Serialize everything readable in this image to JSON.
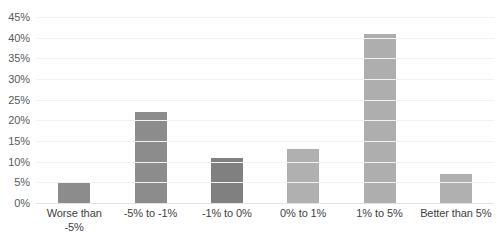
{
  "chart_data": {
    "type": "bar",
    "title": "",
    "subtitle": "",
    "xlabel": "",
    "ylabel": "",
    "categories": [
      "Worse than -5%",
      "-5% to -1%",
      "-1% to 0%",
      "0% to 1%",
      "1% to 5%",
      "Better than 5%"
    ],
    "values": [
      5,
      22,
      11,
      13,
      41,
      7
    ],
    "value_labels": [
      "5%",
      "22%",
      "11%",
      "13%",
      "41%",
      "7%"
    ],
    "bar_colors": [
      "#8c8c8c",
      "#8c8c8c",
      "#808080",
      "#b0b0b0",
      "#aeaeae",
      "#b0b0b0"
    ],
    "ylim": [
      0,
      45
    ],
    "ytick_step": 5,
    "ytick_labels": [
      "0%",
      "5%",
      "10%",
      "15%",
      "20%",
      "25%",
      "30%",
      "35%",
      "40%",
      "45%"
    ],
    "ytick_values": [
      0,
      5,
      10,
      15,
      20,
      25,
      30,
      35,
      40,
      45
    ],
    "grid": true,
    "grid_color": "#f2f2f2",
    "axis_line_color": "#e3e3e3",
    "legend": false,
    "legend_position": "none",
    "background": "#ffffff"
  }
}
